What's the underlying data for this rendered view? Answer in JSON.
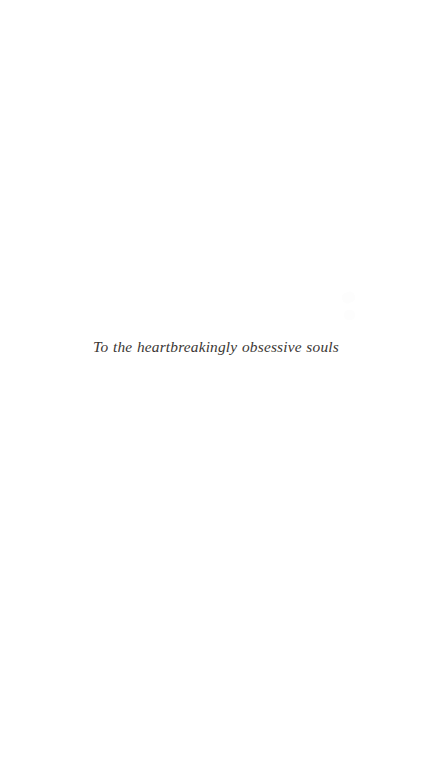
{
  "page": {
    "kind": "book-dedication-page",
    "background_color": "#ffffff",
    "width": 432,
    "height": 768
  },
  "dedication": {
    "text": "To the heartbreakingly obsessive souls",
    "text_color": "#3b3734",
    "style": "italic-serif",
    "alignment": "center"
  },
  "artifacts": {
    "speckle_color": "#fdfdfd",
    "note": ""
  }
}
